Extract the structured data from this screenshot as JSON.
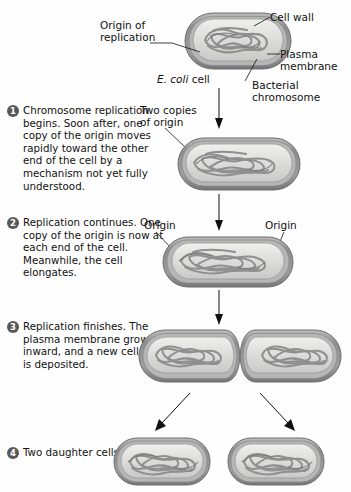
{
  "figure": {
    "topic": "Bacterial binary fission — chromosome replication and cell division in E. coli"
  },
  "labels": {
    "origin_of_replication": "Origin of\nreplication",
    "cell_wall": "Cell wall",
    "plasma_membrane": "Plasma\nmembrane",
    "bacterial_chromosome": "Bacterial\nchromosome",
    "ecoli_cell_italic": "E. coli",
    "ecoli_cell_roman": " cell",
    "two_copies_of_origin": "Two copies\nof origin",
    "origin_left": "Origin",
    "origin_right": "Origin"
  },
  "steps": [
    {
      "number": "1",
      "text": "Chromosome\nreplication begins.\nSoon after, one copy\nof the origin moves\nrapidly toward the\nother end of the cell by\na mechanism not yet\nfully understood."
    },
    {
      "number": "2",
      "text": "Replication continues.\nOne copy of the origin\nis now at each end of\nthe cell. Meanwhile,\nthe cell elongates."
    },
    {
      "number": "3",
      "text": "Replication finishes.\nThe plasma membrane\ngrows inward, and\na new cell wall is\ndeposited."
    },
    {
      "number": "4",
      "text": "Two daughter\ncells result."
    }
  ],
  "colors": {
    "cell_wall": "#8d8d8f",
    "cell_wall_dark": "#6e6e70",
    "plasma_membrane": "#a8a8aa",
    "cytoplasm": "#d8d8d6",
    "cytoplasm_light": "#e8e8e6",
    "chromosome": "#9a9a9c",
    "chromosome_dark": "#7b7b7d",
    "badge": "#58585a",
    "line": "#111111",
    "background": "#fefefe"
  }
}
